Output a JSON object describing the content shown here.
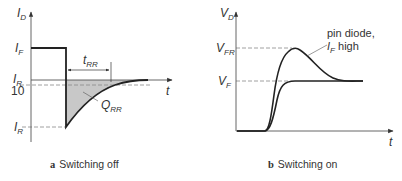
{
  "panel_a": {
    "caption_letter": "a",
    "caption_text": "Switching off",
    "y_axis_label": "I",
    "y_axis_sub": "D",
    "x_axis_label": "t",
    "labels": {
      "if": "I",
      "if_sub": "F",
      "ir_frac_num": "I",
      "ir_frac_sub": "R",
      "ir_frac_den": "10",
      "ir": "I",
      "ir_sub": "R",
      "trr": "t",
      "trr_sub": "RR",
      "qrr": "Q",
      "qrr_sub": "RR"
    }
  },
  "panel_b": {
    "caption_letter": "b",
    "caption_text": "Switching on",
    "y_axis_label": "V",
    "y_axis_sub": "D",
    "x_axis_label": "t",
    "labels": {
      "vfr": "V",
      "vfr_sub": "FR",
      "vf": "V",
      "vf_sub": "F",
      "note_line1": "pin diode,",
      "note_line2_i": "I",
      "note_line2_sub": "F",
      "note_line2_rest": " high"
    }
  },
  "colors": {
    "curve": "#222222",
    "axis": "#555555",
    "dashed": "#888888",
    "fill": "#c8c8c8"
  }
}
